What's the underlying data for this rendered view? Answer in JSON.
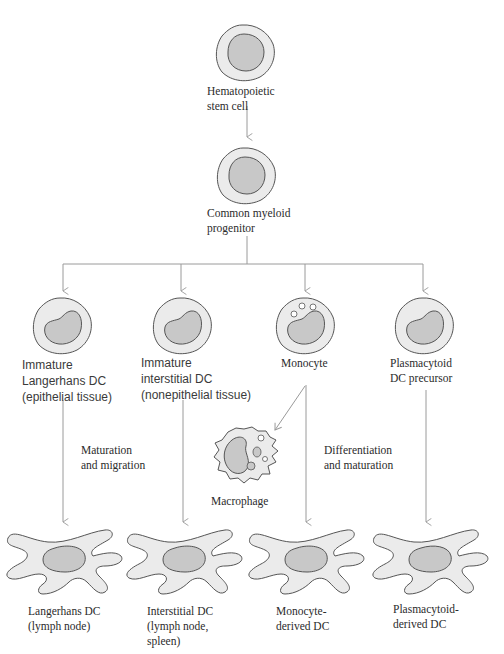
{
  "diagram": {
    "colors": {
      "cell_fill": "#ebebeb",
      "nucleus_fill": "#c8c8c8",
      "outline": "#555555",
      "arrow": "#9a9a9a",
      "text": "#2b2b2b"
    },
    "nodes": {
      "hsc": {
        "label": "Hematopoietic\nstem cell",
        "icon": "round-cell-icon"
      },
      "cmp": {
        "label": "Common myeloid\nprogenitor",
        "icon": "round-cell-icon"
      },
      "immature_lc": {
        "label": "Immature\nLangerhans DC\n(epithelial tissue)",
        "icon": "immature-dc-icon"
      },
      "immature_idc": {
        "label": "Immature\ninterstitial DC\n(nonepithelial tissue)",
        "icon": "immature-dc-icon"
      },
      "monocyte": {
        "label": "Monocyte",
        "icon": "monocyte-icon"
      },
      "pdc_precursor": {
        "label": "Plasmacytoid\nDC precursor",
        "icon": "immature-dc-icon"
      },
      "macrophage": {
        "label": "Macrophage",
        "icon": "macrophage-icon"
      },
      "lc": {
        "label": "Langerhans DC\n(lymph node)",
        "icon": "mature-dc-icon"
      },
      "idc": {
        "label": "Interstitial DC\n(lymph node,\nspleen)",
        "icon": "mature-dc-icon"
      },
      "mo_dc": {
        "label": "Monocyte-\nderived DC",
        "icon": "mature-dc-icon"
      },
      "p_dc": {
        "label": "Plasmacytoid-\nderived DC",
        "icon": "mature-dc-icon"
      }
    },
    "edge_labels": {
      "maturation_migration": "Maturation\nand migration",
      "differentiation_maturation": "Differentiation\nand maturation"
    },
    "edges": [
      [
        "hsc",
        "cmp"
      ],
      [
        "cmp",
        "immature_lc"
      ],
      [
        "cmp",
        "immature_idc"
      ],
      [
        "cmp",
        "monocyte"
      ],
      [
        "cmp",
        "pdc_precursor"
      ],
      [
        "immature_lc",
        "lc"
      ],
      [
        "immature_idc",
        "idc"
      ],
      [
        "monocyte",
        "macrophage"
      ],
      [
        "monocyte",
        "mo_dc"
      ],
      [
        "pdc_precursor",
        "p_dc"
      ]
    ]
  }
}
